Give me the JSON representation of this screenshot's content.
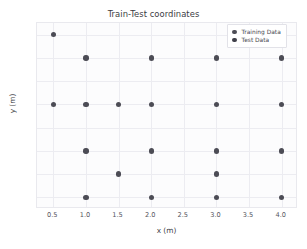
{
  "chart_data": {
    "type": "scatter",
    "title": "Train-Test coordinates",
    "xlabel": "x  (m)",
    "ylabel": "y  (m)",
    "xlim": [
      0.25,
      4.25
    ],
    "ylim": [
      0.75,
      4.75
    ],
    "xticks": [
      "0.5",
      "1.0",
      "1.5",
      "2.0",
      "2.5",
      "3.0",
      "3.5",
      "4.0"
    ],
    "xtick_values": [
      0.5,
      1.0,
      1.5,
      2.0,
      2.5,
      3.0,
      3.5,
      4.0
    ],
    "yticks": [
      "1.0",
      "1.5",
      "2.0",
      "2.5",
      "3.0",
      "3.5",
      "4.0",
      "4.5"
    ],
    "ytick_values": [
      1.0,
      1.5,
      2.0,
      2.5,
      3.0,
      3.5,
      4.0,
      4.5
    ],
    "grid": true,
    "legend_position": "upper right",
    "marker_color": "#4c4c55",
    "test_marker_color": "#3f3f49",
    "background_color": "#fcfcfd",
    "series": [
      {
        "name": "Training Data",
        "color": "#4c4c55",
        "points": [
          [
            0.5,
            4.5
          ],
          [
            1.0,
            4.0
          ],
          [
            2.0,
            4.0
          ],
          [
            3.0,
            4.0
          ],
          [
            4.0,
            4.0
          ],
          [
            0.5,
            3.0
          ],
          [
            1.0,
            3.0
          ],
          [
            1.5,
            3.0
          ],
          [
            2.0,
            3.0
          ],
          [
            3.0,
            3.0
          ],
          [
            4.0,
            3.0
          ],
          [
            1.0,
            2.0
          ],
          [
            2.0,
            2.0
          ],
          [
            3.0,
            2.0
          ],
          [
            4.0,
            2.0
          ],
          [
            1.5,
            1.5
          ],
          [
            3.0,
            1.5
          ],
          [
            1.0,
            1.0
          ],
          [
            2.0,
            1.0
          ],
          [
            3.0,
            1.0
          ],
          [
            4.0,
            1.0
          ]
        ]
      },
      {
        "name": "Test Data",
        "color": "#3f3f49",
        "points": []
      }
    ]
  },
  "legend": {
    "entries": [
      {
        "label": "Training Data",
        "kind": "training"
      },
      {
        "label": "Test Data",
        "kind": "test"
      }
    ]
  }
}
